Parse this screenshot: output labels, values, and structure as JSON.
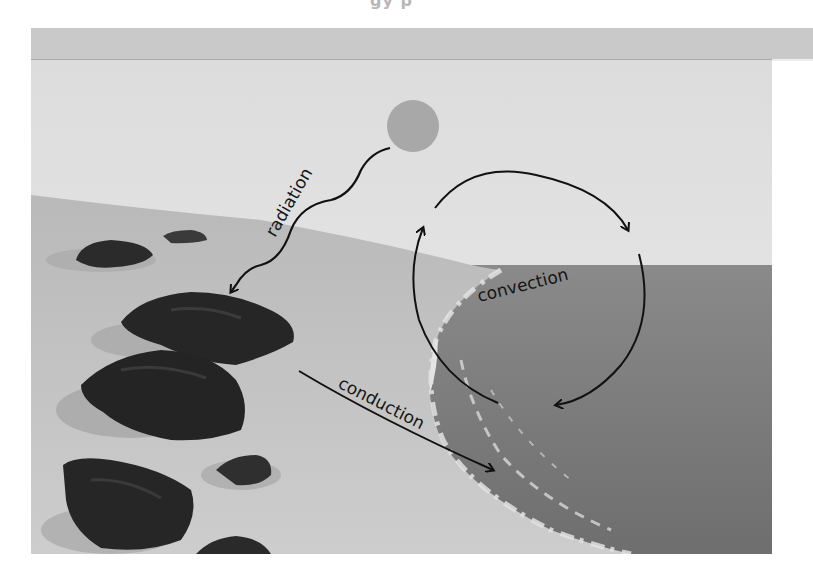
{
  "header": {
    "clipped_title_fragment": "gy p"
  },
  "figure": {
    "labels": {
      "radiation": "radiation",
      "convection": "convection",
      "conduction": "conduction"
    },
    "elements": {
      "sun": "sun",
      "rocks": "rocks on sand",
      "ocean": "ocean",
      "beach": "sandy beach"
    },
    "colors": {
      "sky": "#e3e3e3",
      "sun": "#a9a9a9",
      "sand": "#c6c6c6",
      "ocean": "#7f7f7f",
      "rock": "#2e2e2e",
      "arrow": "#111111",
      "band": "#c9c9c9"
    }
  }
}
